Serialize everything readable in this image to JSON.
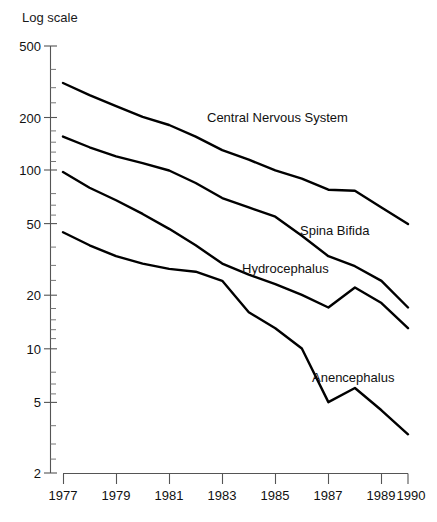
{
  "chart_data": {
    "type": "line",
    "title": "",
    "subtitle": "",
    "axis_note": "Log scale",
    "xlabel": "",
    "ylabel": "",
    "yscale": "log",
    "ylim": [
      2,
      500
    ],
    "xlim": [
      1977,
      1990
    ],
    "grid": false,
    "legend": "inline-labels",
    "ytick_labels": [
      "500",
      "200",
      "100",
      "50",
      "20",
      "10",
      "5",
      "2"
    ],
    "ytick_values": [
      500,
      200,
      100,
      50,
      20,
      10,
      5,
      2
    ],
    "xtick_labels": [
      "1977",
      "1979",
      "1981",
      "1983",
      "1985",
      "1987",
      "1989",
      "1990"
    ],
    "xtick_values": [
      1977,
      1979,
      1981,
      1983,
      1985,
      1987,
      1989,
      1990
    ],
    "x": [
      1977,
      1978,
      1979,
      1980,
      1981,
      1982,
      1983,
      1984,
      1985,
      1986,
      1987,
      1988,
      1989,
      1990
    ],
    "series": [
      {
        "name": "Central Nervous System",
        "label": "Central Nervous System",
        "values": [
          310,
          265,
          230,
          200,
          180,
          155,
          130,
          115,
          100,
          90,
          78,
          77,
          62,
          50
        ]
      },
      {
        "name": "Spina Bifida",
        "label": "Spina Bifida",
        "values": [
          155,
          135,
          120,
          110,
          100,
          85,
          70,
          62,
          55,
          43,
          33,
          29,
          24,
          17
        ]
      },
      {
        "name": "Hydrocephalus",
        "label": "Hydrocephalus",
        "values": [
          98,
          80,
          68,
          57,
          47,
          38,
          30,
          26,
          23,
          20,
          17,
          22,
          18,
          13
        ]
      },
      {
        "name": "Anencephalus",
        "label": "Anencephalus",
        "values": [
          45,
          38,
          33,
          30,
          28,
          27,
          24,
          16,
          13,
          10,
          5,
          6,
          4.5,
          3.3
        ]
      }
    ],
    "colors": {
      "line": "#000000",
      "axis": "#555555",
      "text": "#111111",
      "background": "#ffffff"
    }
  }
}
